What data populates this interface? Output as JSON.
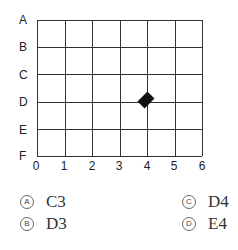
{
  "row_labels": [
    "A",
    "B",
    "C",
    "D",
    "E",
    "F"
  ],
  "col_labels": [
    "0",
    "1",
    "2",
    "3",
    "4",
    "5",
    "6"
  ],
  "marker": {
    "shape": "diamond",
    "row": "D",
    "col": "4"
  },
  "options": [
    {
      "letter": "A",
      "text": "C3"
    },
    {
      "letter": "B",
      "text": "D3"
    },
    {
      "letter": "C",
      "text": "D4"
    },
    {
      "letter": "D",
      "text": "E4"
    }
  ]
}
